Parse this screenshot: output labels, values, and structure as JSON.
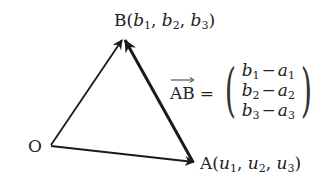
{
  "diagram": {
    "type": "vector-triangle",
    "points": {
      "O": {
        "name": "O",
        "x": 50,
        "y": 146
      },
      "A": {
        "name": "A",
        "x": 195,
        "y": 163,
        "coords": [
          "u",
          "u",
          "u"
        ],
        "subscripts": [
          "1",
          "2",
          "3"
        ]
      },
      "B": {
        "name": "B",
        "x": 123,
        "y": 38,
        "coords": [
          "b",
          "b",
          "b"
        ],
        "subscripts": [
          "1",
          "2",
          "3"
        ]
      }
    },
    "arrows": [
      {
        "from": "O",
        "to": "B",
        "weight": "normal"
      },
      {
        "from": "O",
        "to": "A",
        "weight": "normal"
      },
      {
        "from": "A",
        "to": "B",
        "weight": "bold"
      }
    ],
    "labels": {
      "O": "O",
      "A": {
        "letter": "A",
        "v1": "u",
        "s1": "1",
        "v2": "u",
        "s2": "2",
        "v3": "u",
        "s3": "3"
      },
      "B": {
        "letter": "B",
        "v1": "b",
        "s1": "1",
        "v2": "b",
        "s2": "2",
        "v3": "b",
        "s3": "3"
      }
    },
    "formula": {
      "vector": "AB",
      "equals": "=",
      "rows": [
        {
          "b": "b",
          "bs": "1",
          "op": "−",
          "a": "a",
          "as": "1"
        },
        {
          "b": "b",
          "bs": "2",
          "op": "−",
          "a": "a",
          "as": "2"
        },
        {
          "b": "b",
          "bs": "3",
          "op": "−",
          "a": "a",
          "as": "3"
        }
      ],
      "open_paren": "(",
      "close_paren": ")"
    },
    "colors": {
      "stroke": "#1a1a1a",
      "text": "#222222",
      "background": "#ffffff"
    }
  }
}
